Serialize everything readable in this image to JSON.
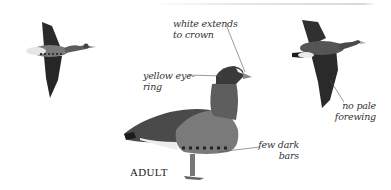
{
  "figure": {
    "caption": "ADULT",
    "annotations": [
      {
        "id": "crown",
        "lines": [
          "white extends",
          "to crown"
        ]
      },
      {
        "id": "eye",
        "lines": [
          "yellow eye-",
          "ring"
        ]
      },
      {
        "id": "forewing",
        "lines": [
          "no pale",
          "forewing"
        ]
      },
      {
        "id": "bars",
        "lines": [
          "few dark",
          "bars"
        ]
      }
    ],
    "colors": {
      "background": "#ffffff",
      "wing_dark": "#2a2a2a",
      "body_mid": "#6a6a6a",
      "belly_light": "#e8e8e8",
      "leader_line": "#555555"
    }
  }
}
